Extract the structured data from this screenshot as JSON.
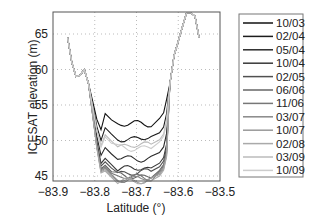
{
  "chart_data": {
    "type": "line",
    "title": "",
    "xlabel": "Latitude (°)",
    "ylabel": "ICESAT elevation (m)",
    "xlim": [
      -83.9,
      -83.5
    ],
    "ylim": [
      44,
      68
    ],
    "xticks": [
      "-83.9",
      "-83.8",
      "-83.7",
      "-83.6",
      "-83.5"
    ],
    "yticks": [
      "45",
      "50",
      "55",
      "60",
      "65"
    ],
    "grid": true,
    "legend_position": "outside-right",
    "series": [
      {
        "name": "10/03",
        "color": "#111111",
        "floor": 52.3
      },
      {
        "name": "02/04",
        "color": "#1c1c1c",
        "floor": 50.3
      },
      {
        "name": "05/04",
        "color": "#2a2a2a",
        "floor": 47.5
      },
      {
        "name": "10/04",
        "color": "#383838",
        "floor": 46.0
      },
      {
        "name": "02/05",
        "color": "#505050",
        "floor": 45.5
      },
      {
        "name": "06/06",
        "color": "#666666",
        "floor": 45.0
      },
      {
        "name": "11/06",
        "color": "#777777",
        "floor": 44.8
      },
      {
        "name": "03/07",
        "color": "#888888",
        "floor": 44.6
      },
      {
        "name": "10/07",
        "color": "#999999",
        "floor": 44.4
      },
      {
        "name": "02/08",
        "color": "#aaaaaa",
        "floor": 44.2
      },
      {
        "name": "03/09",
        "color": "#bbbbbb",
        "floor": 49.3
      },
      {
        "name": "10/09",
        "color": "#cccccc",
        "floor": 49.0
      }
    ],
    "shared_profile": {
      "x": [
        -83.865,
        -83.855,
        -83.845,
        -83.835,
        -83.825,
        -83.815,
        -83.805,
        -83.795,
        -83.785
      ],
      "y": [
        64.5,
        61.0,
        59.0,
        59.2,
        60.0,
        58.0,
        55.5,
        53.0,
        51.5
      ]
    },
    "right_profile": {
      "x": [
        -83.62,
        -83.61,
        -83.6,
        -83.59,
        -83.58,
        -83.57,
        -83.56,
        -83.55
      ],
      "y": [
        58.0,
        62.0,
        64.0,
        66.0,
        68.0,
        68.0,
        67.5,
        64.5
      ]
    }
  }
}
